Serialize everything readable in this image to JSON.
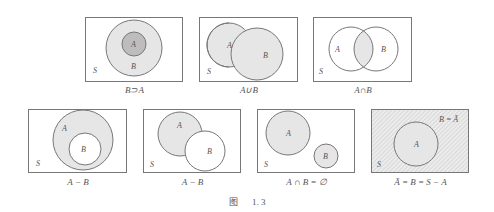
{
  "colors": {
    "border": "#777777",
    "fill": "#e6e6e6",
    "fill_dark": "#bdbdbd",
    "text": "#555555"
  },
  "figure": {
    "caption_prefix": "图",
    "caption_number": "1. 3"
  },
  "diagrams": [
    {
      "id": "b-superset-a",
      "caption": "B⊃A",
      "sets": {
        "S": "S",
        "A": "A",
        "B": "B"
      }
    },
    {
      "id": "a-union-b",
      "caption": "A∪B",
      "sets": {
        "S": "S",
        "A": "A",
        "B": "B"
      }
    },
    {
      "id": "a-intersect-b",
      "caption": "A∩B",
      "sets": {
        "S": "S",
        "A": "A",
        "B": "B"
      }
    },
    {
      "id": "a-minus-b-nested",
      "caption": "A − B",
      "sets": {
        "S": "S",
        "A": "A",
        "B": "B"
      }
    },
    {
      "id": "a-minus-b-overlap",
      "caption": "A − B",
      "sets": {
        "S": "S",
        "A": "A",
        "B": "B"
      }
    },
    {
      "id": "disjoint",
      "caption": "A ∩ B = ∅",
      "sets": {
        "S": "S",
        "A": "A",
        "B": "B"
      }
    },
    {
      "id": "complement",
      "caption": "Ā = B = S − A",
      "sets": {
        "S": "S",
        "A": "A",
        "B": "B = Ā"
      }
    }
  ]
}
